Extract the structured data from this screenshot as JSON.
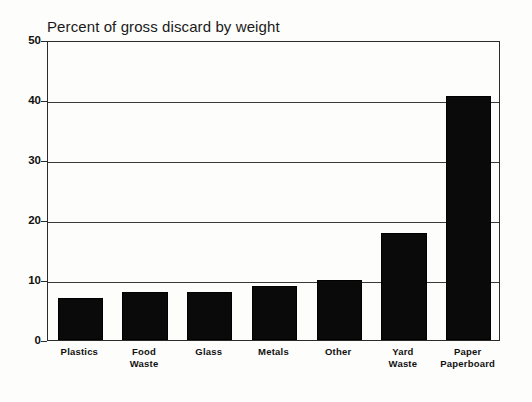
{
  "chart_data": {
    "type": "bar",
    "title": "Percent of gross discard by weight",
    "xlabel": "",
    "ylabel": "",
    "ylim": [
      0,
      50
    ],
    "yticks": [
      0,
      10,
      20,
      30,
      40,
      50
    ],
    "grid": true,
    "legend": false,
    "categories": [
      "Plastics",
      "Food Waste",
      "Glass",
      "Metals",
      "Other",
      "Yard Waste",
      "Paper Paperboard"
    ],
    "category_lines": [
      [
        "Plastics"
      ],
      [
        "Food",
        "Waste"
      ],
      [
        "Glass"
      ],
      [
        "Metals"
      ],
      [
        "Other"
      ],
      [
        "Yard",
        "Waste"
      ],
      [
        "Paper",
        "Paperboard"
      ]
    ],
    "values": [
      7,
      8,
      8,
      9,
      10,
      17.8,
      40.7
    ],
    "bar_color": "#0a0a0a",
    "axis_color": "#2b2b2b",
    "background_color": "#fdfdfb"
  }
}
